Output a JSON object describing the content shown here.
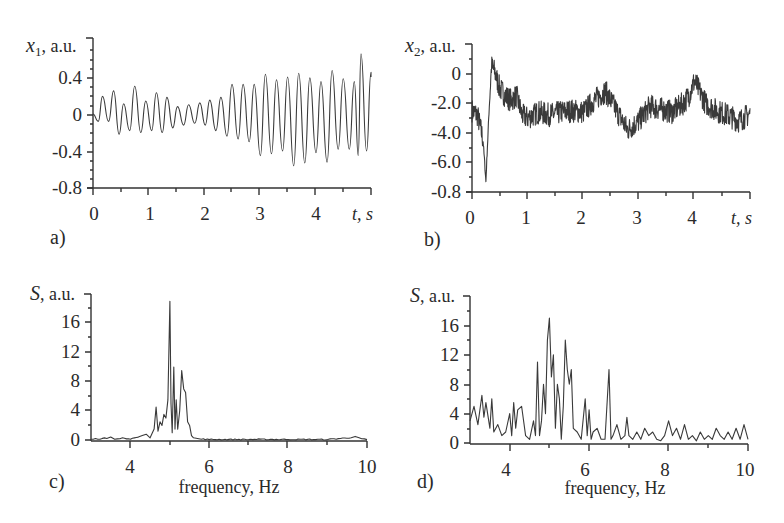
{
  "figure": {
    "background": "#ffffff",
    "line_color": "#3a3a3a"
  },
  "chart_data": [
    {
      "id": "a",
      "panel_label": "a)",
      "type": "line",
      "title": "",
      "xlabel": "t, s",
      "ylabel": "x1, a.u.",
      "ylabel_var": "x",
      "ylabel_sub": "1",
      "ylabel_unit": ", a.u.",
      "xlabel_var": "t",
      "xlabel_unit": ", s",
      "xlim": [
        0,
        5
      ],
      "ylim": [
        -0.8,
        0.8
      ],
      "xticks": [
        0,
        1,
        2,
        3,
        4
      ],
      "xtick_labels": [
        "0",
        "1",
        "2",
        "3",
        "4"
      ],
      "yticks": [
        0.4,
        0,
        -0.4,
        -0.8
      ],
      "ytick_labels": [
        "0.4",
        "0",
        "-0.4",
        "-0.8"
      ],
      "grid": false,
      "description": "Oscillation ~5 Hz; amplitude ~0.2 for t<2.3 s, growing to ~0.45 for t>2.5 s, peak ~0.65 near t=4.8 s",
      "x": [
        0.0,
        0.1,
        0.2,
        0.3,
        0.4,
        0.5,
        0.6,
        0.7,
        0.8,
        0.9,
        1.0,
        1.1,
        1.2,
        1.3,
        1.4,
        1.5,
        1.6,
        1.7,
        1.8,
        1.9,
        2.0,
        2.1,
        2.2,
        2.3,
        2.4,
        2.5,
        2.6,
        2.7,
        2.8,
        2.9,
        3.0,
        3.1,
        3.2,
        3.3,
        3.4,
        3.5,
        3.6,
        3.7,
        3.8,
        3.9,
        4.0,
        4.1,
        4.2,
        4.3,
        4.4,
        4.5,
        4.6,
        4.7,
        4.8,
        4.9,
        5.0
      ],
      "peaks_t": [
        0.17,
        0.37,
        0.55,
        0.75,
        0.95,
        1.14,
        1.33,
        1.52,
        1.72,
        1.92,
        2.1,
        2.3,
        2.5,
        2.7,
        2.9,
        3.1,
        3.3,
        3.5,
        3.7,
        3.9,
        4.1,
        4.3,
        4.5,
        4.7,
        4.82,
        5.0
      ],
      "peaks_y": [
        0.19,
        0.25,
        0.11,
        0.3,
        0.14,
        0.23,
        0.18,
        0.08,
        0.1,
        0.12,
        0.15,
        0.18,
        0.32,
        0.32,
        0.32,
        0.43,
        0.37,
        0.4,
        0.44,
        0.39,
        0.35,
        0.47,
        0.38,
        0.35,
        0.65,
        0.45
      ],
      "troughs_y": [
        -0.08,
        -0.22,
        -0.18,
        -0.2,
        -0.18,
        -0.2,
        -0.15,
        -0.12,
        -0.1,
        -0.12,
        -0.18,
        -0.24,
        -0.27,
        -0.3,
        -0.45,
        -0.43,
        -0.4,
        -0.56,
        -0.53,
        -0.42,
        -0.52,
        -0.38,
        -0.38,
        -0.45,
        -0.4,
        -0.35
      ]
    },
    {
      "id": "b",
      "panel_label": "b)",
      "type": "line",
      "title": "",
      "xlabel": "t, s",
      "ylabel": "x2, a.u.",
      "ylabel_var": "x",
      "ylabel_sub": "2",
      "ylabel_unit": ", a.u.",
      "xlabel_var": "t",
      "xlabel_unit": ", s",
      "xlim": [
        0,
        5
      ],
      "ylim": [
        -8.0,
        2.0
      ],
      "xticks": [
        0,
        1,
        2,
        3,
        4
      ],
      "xtick_labels": [
        "0",
        "1",
        "2",
        "3",
        "4"
      ],
      "yticks": [
        0,
        -2.0,
        -4.0,
        -6.0,
        -8.0
      ],
      "ytick_labels": [
        "0",
        "-2.0",
        "-4.0",
        "-6.0",
        "-0.8"
      ],
      "grid": false,
      "description": "Noisy signal around -2.5; sharp dip to ~-7.3 at t≈0.25 s then spike to ~+0.8 at t≈0.35 s",
      "x": [
        0.0,
        0.1,
        0.2,
        0.25,
        0.3,
        0.35,
        0.4,
        0.5,
        0.6,
        0.7,
        0.8,
        0.9,
        1.0,
        1.2,
        1.4,
        1.6,
        1.8,
        2.0,
        2.2,
        2.4,
        2.6,
        2.8,
        3.0,
        3.2,
        3.4,
        3.6,
        3.8,
        3.9,
        4.0,
        4.2,
        4.4,
        4.6,
        4.8,
        5.0
      ],
      "y": [
        -2.5,
        -2.8,
        -4.5,
        -7.3,
        -3.0,
        0.5,
        0.2,
        -1.0,
        -1.5,
        -1.8,
        -1.5,
        -2.8,
        -3.0,
        -2.6,
        -2.8,
        -2.6,
        -2.5,
        -2.6,
        -1.8,
        -1.2,
        -2.5,
        -3.8,
        -3.2,
        -2.2,
        -2.4,
        -2.6,
        -2.0,
        -1.5,
        -0.5,
        -2.0,
        -2.5,
        -2.8,
        -3.2,
        -2.7
      ],
      "noise_amplitude": 0.8
    },
    {
      "id": "c",
      "panel_label": "c)",
      "type": "line",
      "title": "",
      "xlabel": "frequency, Hz",
      "ylabel": "S, a.u.",
      "ylabel_var": "S",
      "ylabel_unit": ", a.u.",
      "xlim": [
        3,
        10
      ],
      "ylim": [
        0,
        20
      ],
      "xticks": [
        4,
        6,
        8,
        10
      ],
      "xtick_labels": [
        "4",
        "6",
        "8",
        "10"
      ],
      "yticks": [
        16,
        12,
        8,
        4,
        0
      ],
      "ytick_labels": [
        "16",
        "12",
        "8",
        "4",
        "0"
      ],
      "grid": false,
      "description": "Narrow spectrum: main peak ~19 at 5.0 Hz, secondary peaks ~10 at 5.1 Hz and ~9 at 5.3 Hz, ~4.5 at 4.65 Hz",
      "x": [
        3.0,
        3.4,
        3.5,
        3.6,
        3.8,
        4.0,
        4.2,
        4.3,
        4.4,
        4.5,
        4.6,
        4.65,
        4.7,
        4.75,
        4.8,
        4.85,
        4.9,
        4.95,
        5.0,
        5.03,
        5.06,
        5.1,
        5.13,
        5.16,
        5.2,
        5.25,
        5.3,
        5.35,
        5.4,
        5.45,
        5.5,
        5.55,
        5.6,
        5.7,
        5.8,
        6.0,
        7.0,
        8.0,
        9.0,
        9.6,
        9.7,
        9.8,
        10.0
      ],
      "y": [
        0.1,
        0.2,
        0.4,
        0.1,
        0.3,
        0.1,
        0.4,
        0.6,
        0.8,
        0.3,
        1.5,
        4.5,
        1.2,
        2.5,
        2.0,
        3.5,
        3.0,
        5.5,
        19.0,
        5.0,
        1.0,
        10.0,
        1.5,
        5.5,
        1.5,
        4.0,
        9.5,
        7.0,
        6.5,
        2.5,
        2.0,
        0.6,
        0.3,
        0.2,
        0.1,
        0.05,
        0.05,
        0.05,
        0.05,
        0.3,
        0.5,
        0.3,
        0.05
      ]
    },
    {
      "id": "d",
      "panel_label": "d)",
      "type": "line",
      "title": "",
      "xlabel": "frequency, Hz",
      "ylabel": "S, a.u.",
      "ylabel_var": "S",
      "ylabel_unit": ", a.u.",
      "xlim": [
        3,
        10
      ],
      "ylim": [
        0,
        20
      ],
      "xticks": [
        4,
        6,
        8,
        10
      ],
      "xtick_labels": [
        "4",
        "6",
        "8",
        "10"
      ],
      "yticks": [
        16,
        12,
        8,
        4,
        0
      ],
      "ytick_labels": [
        "16",
        "12",
        "8",
        "4",
        "0"
      ],
      "grid": false,
      "description": "Broad noisy spectrum: peak ~17 at 5.0 Hz, ~14 at 5.45 Hz, ~11 at 4.7 Hz, ~10 at 6.5 Hz, background 0–6",
      "x": [
        3.0,
        3.1,
        3.2,
        3.3,
        3.35,
        3.4,
        3.5,
        3.55,
        3.6,
        3.7,
        3.8,
        3.9,
        4.0,
        4.05,
        4.1,
        4.15,
        4.2,
        4.3,
        4.4,
        4.5,
        4.6,
        4.65,
        4.7,
        4.75,
        4.8,
        4.85,
        4.9,
        4.95,
        5.0,
        5.05,
        5.1,
        5.15,
        5.2,
        5.25,
        5.3,
        5.35,
        5.4,
        5.45,
        5.5,
        5.55,
        5.6,
        5.7,
        5.8,
        5.9,
        5.95,
        6.0,
        6.05,
        6.1,
        6.2,
        6.3,
        6.4,
        6.5,
        6.55,
        6.6,
        6.7,
        6.8,
        6.9,
        6.95,
        7.0,
        7.1,
        7.2,
        7.3,
        7.4,
        7.5,
        7.6,
        7.7,
        7.8,
        7.9,
        8.0,
        8.1,
        8.2,
        8.3,
        8.4,
        8.5,
        8.6,
        8.7,
        8.8,
        8.9,
        9.0,
        9.1,
        9.2,
        9.3,
        9.4,
        9.5,
        9.6,
        9.7,
        9.8,
        9.9,
        10.0
      ],
      "y": [
        3.0,
        5.0,
        2.5,
        6.5,
        3.5,
        5.5,
        2.0,
        6.0,
        1.5,
        2.5,
        1.0,
        1.5,
        4.0,
        1.0,
        5.5,
        2.0,
        4.5,
        5.0,
        1.0,
        0.5,
        3.0,
        1.0,
        11.0,
        1.0,
        3.0,
        8.0,
        4.0,
        14.0,
        17.0,
        9.0,
        12.0,
        2.0,
        8.0,
        6.0,
        0.5,
        5.0,
        14.0,
        10.0,
        8.0,
        10.0,
        2.0,
        1.5,
        0.5,
        6.0,
        1.0,
        4.5,
        0.5,
        1.5,
        2.0,
        0.5,
        0.5,
        10.0,
        0.5,
        1.0,
        2.5,
        0.5,
        1.0,
        3.5,
        1.0,
        0.5,
        1.5,
        0.5,
        2.0,
        1.0,
        1.5,
        0.5,
        0.3,
        1.0,
        3.0,
        1.0,
        2.0,
        0.5,
        2.5,
        0.5,
        1.0,
        0.3,
        1.5,
        0.5,
        1.0,
        0.5,
        2.0,
        1.0,
        0.5,
        1.5,
        0.5,
        2.0,
        0.5,
        2.5,
        0.5
      ]
    }
  ],
  "panels": {
    "a": {
      "tag": "a)",
      "ylabel_var": "x",
      "ylabel_sub": "1",
      "ylabel_unit": ", a.u.",
      "xlabel_var": "t",
      "xlabel_unit": ", s",
      "yt": [
        "0.4",
        "0",
        "-0.4",
        "-0.8"
      ],
      "xt": [
        "0",
        "1",
        "2",
        "3",
        "4"
      ]
    },
    "b": {
      "tag": "b)",
      "ylabel_var": "x",
      "ylabel_sub": "2",
      "ylabel_unit": ", a.u.",
      "xlabel_var": "t",
      "xlabel_unit": ", s",
      "yt": [
        "0",
        "-2.0",
        "-4.0",
        "-6.0",
        "-0.8"
      ],
      "xt": [
        "0",
        "1",
        "2",
        "3",
        "4"
      ]
    },
    "c": {
      "tag": "c)",
      "ylabel_var": "S",
      "ylabel_unit": ", a.u.",
      "xlabel": "frequency, Hz",
      "yt": [
        "16",
        "12",
        "8",
        "4",
        "0"
      ],
      "xt": [
        "4",
        "6",
        "8",
        "10"
      ]
    },
    "d": {
      "tag": "d)",
      "ylabel_var": "S",
      "ylabel_unit": ", a.u.",
      "xlabel": "frequency, Hz",
      "yt": [
        "16",
        "12",
        "8",
        "4",
        "0"
      ],
      "xt": [
        "4",
        "6",
        "8",
        "10"
      ]
    }
  }
}
